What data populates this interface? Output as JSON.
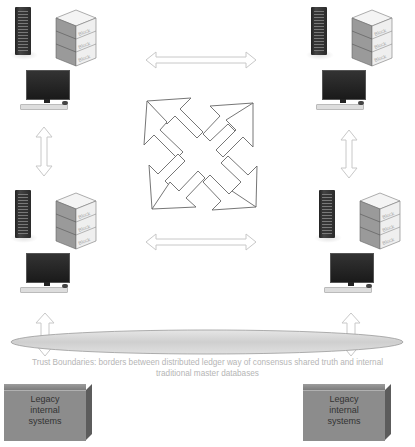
{
  "diagram": {
    "title": "",
    "nodes": [
      {
        "id": "node-top-left",
        "block_labels": [
          "Block",
          "Block",
          "Block"
        ]
      },
      {
        "id": "node-top-right",
        "block_labels": [
          "Block",
          "Block",
          "Block"
        ]
      },
      {
        "id": "node-bottom-left",
        "block_labels": [
          "Block",
          "Block",
          "Block"
        ]
      },
      {
        "id": "node-bottom-right",
        "block_labels": [
          "Block",
          "Block",
          "Block"
        ]
      }
    ],
    "center_icon": "four-way-arrow",
    "trust_boundary": {
      "caption_line1": "Trust Boundaries: borders between distributed ledger way of consensus shared truth and internal",
      "caption_line2": "traditional master databases"
    },
    "legacy_systems": [
      {
        "label_line1": "Legacy",
        "label_line2": "internal",
        "label_line3": "systems"
      },
      {
        "label_line1": "Legacy",
        "label_line2": "internal",
        "label_line3": "systems"
      }
    ],
    "colors": {
      "arrow_stroke": "#c8c8c8",
      "center_arrow_stroke": "#555555",
      "boundary_fill": "#d9d9d9",
      "legacy_fill": "#8c8c8c",
      "caption_text": "#b5b5b5"
    }
  }
}
